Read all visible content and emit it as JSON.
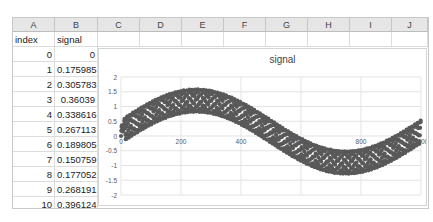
{
  "spreadsheet": {
    "columns": [
      "A",
      "B",
      "C",
      "D",
      "E",
      "F",
      "G",
      "H",
      "I",
      "J"
    ],
    "headers": {
      "A": "index",
      "B": "signal"
    },
    "rows": [
      {
        "index": "0",
        "signal": "0"
      },
      {
        "index": "1",
        "signal": "0.175985"
      },
      {
        "index": "2",
        "signal": "0.305783"
      },
      {
        "index": "3",
        "signal": "0.36039"
      },
      {
        "index": "4",
        "signal": "0.338616"
      },
      {
        "index": "5",
        "signal": "0.267113"
      },
      {
        "index": "6",
        "signal": "0.189805"
      },
      {
        "index": "7",
        "signal": "0.150759"
      },
      {
        "index": "8",
        "signal": "0.177052"
      },
      {
        "index": "9",
        "signal": "0.268191"
      },
      {
        "index": "10",
        "signal": "0.396124"
      },
      {
        "index": "11",
        "signal": "0.515847"
      },
      {
        "index": "12",
        "signal": "0.580553"
      }
    ]
  },
  "chart_data": {
    "type": "scatter",
    "title": "signal",
    "xlabel": "",
    "ylabel": "",
    "xlim": [
      0,
      1000
    ],
    "ylim": [
      -2,
      2
    ],
    "x_ticks": [
      "0",
      "200",
      "400",
      "600",
      "800",
      "1000"
    ],
    "y_ticks": [
      "2",
      "1.5",
      "1",
      "0.5",
      "0",
      "-0.5",
      "-1",
      "-1.5",
      "-2"
    ],
    "grid": true,
    "legend": "none",
    "marker_color": "#595959",
    "series": [
      {
        "name": "signal",
        "description": "slow sine (period ~1000, amplitude ~1) plus fast oscillation (amplitude ~0.35)",
        "x": [
          0,
          1,
          2,
          3,
          4,
          5,
          6,
          7,
          8,
          9,
          10,
          11,
          12
        ],
        "values": [
          0,
          0.175985,
          0.305783,
          0.36039,
          0.338616,
          0.267113,
          0.189805,
          0.150759,
          0.177052,
          0.268191,
          0.396124,
          0.515847,
          0.580553
        ],
        "model": {
          "slow_amp": 1.05,
          "slow_period": 1000,
          "fast_amp": 0.38,
          "fast_period": 9.4,
          "n_points": 1000
        }
      }
    ]
  }
}
